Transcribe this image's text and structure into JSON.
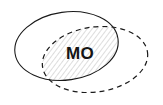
{
  "diagram": {
    "type": "venn-two-set-overlap",
    "background_color": "#ffffff",
    "title": "",
    "intersection_label": "MO",
    "sets": [
      {
        "id": "set-solid",
        "name": "solid-ellipse",
        "stroke_style": "solid",
        "stroke_color": "#1a1a1a",
        "stroke_width": 1.1,
        "fill": "none",
        "label": "",
        "center_x": 66.5,
        "center_y": 46,
        "radius_x": 52,
        "radius_y": 34,
        "rotation_deg": -8
      },
      {
        "id": "set-dashed",
        "name": "dashed-ellipse",
        "stroke_style": "dashed",
        "stroke_color": "#1a1a1a",
        "stroke_width": 1.2,
        "dash_pattern": "5 4",
        "fill": "none",
        "label": "",
        "center_x": 95,
        "center_y": 59.5,
        "radius_x": 53,
        "radius_y": 32.5,
        "rotation_deg": -8
      }
    ],
    "intersection": {
      "id": "overlap-region",
      "name": "intersection-region",
      "fill_pattern": "diagonal-hatch",
      "hatch_color": "#b4b4b4",
      "hatch_angle_deg": 45,
      "hatch_spacing_px": 4,
      "hatch_line_width": 0.9,
      "background_fill": "#ffffff",
      "label": "MO",
      "label_color": "#141414",
      "label_x": 80,
      "label_y": 53,
      "label_font_size_px": 17,
      "label_font_weight": "bold"
    }
  }
}
